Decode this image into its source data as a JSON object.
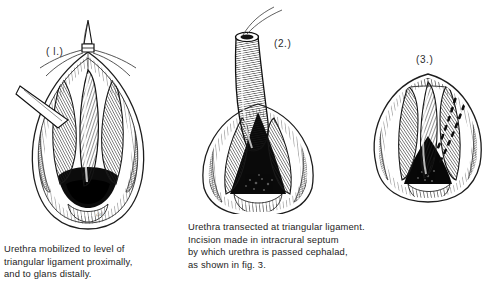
{
  "plate": {
    "background_color": "#ffffff",
    "ink_color": "#1c1c1c",
    "medium": "pen-and-ink surgical illustration"
  },
  "figures": [
    {
      "label": "( l.)",
      "name": "figure-1-urethra-mobilized",
      "description": "Operative field, almond-shaped perineal incision with retracted wound edges; mobilized urethra held by a clamp at the apex; crural muscles splayed on each side.",
      "dark_cavity": true,
      "dashed_incision": false
    },
    {
      "label": "(2.)",
      "name": "figure-2-urethra-transected",
      "description": "Urethra transected at triangular ligament and reflected upward with a traction suture at its free end; open wound below shows dark cavity between crura.",
      "dark_cavity": true,
      "dashed_incision": false
    },
    {
      "label": "(3.)",
      "name": "figure-3-intracrural-septum-incision",
      "description": "Close view of wound with two dashed lines marking planned incision in the intracrural septum through which the urethra is passed cephalad.",
      "dark_cavity": true,
      "dashed_incision": true
    }
  ],
  "captions": {
    "caption_1": "Urethra mobilized to level of\ntriangular ligament proximally,\nand to glans distally.",
    "caption_2": "Urethra transected at triangular ligament.\nIncision made in intracrural septum\nby which urethra is passed cephalad,\nas shown in fig. 3."
  },
  "signature": {
    "text": "del."
  }
}
